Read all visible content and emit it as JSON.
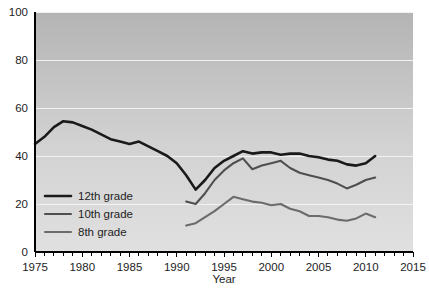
{
  "chart_data": {
    "type": "line",
    "title": "",
    "xlabel": "Year",
    "ylabel": "",
    "xlim": [
      1975,
      2015
    ],
    "ylim": [
      0,
      100
    ],
    "grid": true,
    "legend_position": "inside-left-lower",
    "x_ticks": [
      1975,
      1980,
      1985,
      1990,
      1995,
      2000,
      2005,
      2010,
      2015
    ],
    "x_tick_labels": [
      "1975",
      "1980",
      "1985",
      "1990",
      "1995",
      "2000",
      "2005",
      "2010",
      "2015"
    ],
    "x_minor_tick_step": 1,
    "y_ticks": [
      0,
      20,
      40,
      60,
      80,
      100
    ],
    "y_tick_labels": [
      "0",
      "20",
      "40",
      "60",
      "80",
      "100"
    ],
    "series": [
      {
        "name": "12th grade",
        "color": "#1a1a1a",
        "width": 2.6,
        "x": [
          1975,
          1976,
          1977,
          1978,
          1979,
          1980,
          1981,
          1982,
          1983,
          1984,
          1985,
          1986,
          1987,
          1988,
          1989,
          1990,
          1991,
          1992,
          1993,
          1994,
          1995,
          1996,
          1997,
          1998,
          1999,
          2000,
          2001,
          2002,
          2003,
          2004,
          2005,
          2006,
          2007,
          2008,
          2009,
          2010,
          2011
        ],
        "values": [
          45,
          48,
          52,
          54.5,
          54,
          52.5,
          51,
          49,
          47,
          46,
          45,
          46,
          44,
          42,
          40,
          37,
          32,
          26,
          30,
          35,
          38,
          40,
          42,
          41,
          41.5,
          41.5,
          40.5,
          41,
          41,
          40,
          39.5,
          38.5,
          38,
          36.5,
          36,
          37,
          40
        ]
      },
      {
        "name": "10th grade",
        "color": "#4f4f4f",
        "width": 2.1,
        "x": [
          1991,
          1992,
          1993,
          1994,
          1995,
          1996,
          1997,
          1998,
          1999,
          2000,
          2001,
          2002,
          2003,
          2004,
          2005,
          2006,
          2007,
          2008,
          2009,
          2010,
          2011
        ],
        "values": [
          21,
          20,
          24.5,
          30,
          34,
          37,
          39,
          34.5,
          36,
          37,
          38,
          35,
          33,
          32,
          31,
          30,
          28.5,
          26.5,
          28,
          30,
          31
        ]
      },
      {
        "name": "8th grade",
        "color": "#6b6b6b",
        "width": 2.1,
        "x": [
          1991,
          1992,
          1993,
          1994,
          1995,
          1996,
          1997,
          1998,
          1999,
          2000,
          2001,
          2002,
          2003,
          2004,
          2005,
          2006,
          2007,
          2008,
          2009,
          2010,
          2011
        ],
        "values": [
          11,
          12,
          14.5,
          17,
          20,
          23,
          22,
          21,
          20.5,
          19.5,
          20,
          18,
          17,
          15,
          15,
          14.5,
          13.5,
          13,
          14,
          16,
          14.5
        ]
      }
    ],
    "legend": [
      {
        "label": "12th grade",
        "color": "#1a1a1a",
        "width": 2.6
      },
      {
        "label": "10th grade",
        "color": "#4f4f4f",
        "width": 2.1
      },
      {
        "label": "8th grade",
        "color": "#6b6b6b",
        "width": 2.1
      }
    ],
    "plot_background": {
      "gradient_top": "#b4b4b4",
      "gradient_bottom": "#e0e0e0"
    }
  }
}
